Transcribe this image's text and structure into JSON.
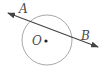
{
  "diagram": {
    "type": "circle-with-secant",
    "circle": {
      "center_label": "O",
      "cx": 47,
      "cy": 40,
      "r": 25,
      "stroke": "#a8a8a8"
    },
    "center_point": {
      "x": 46,
      "y": 41,
      "color": "#222222"
    },
    "line": {
      "x1": 8,
      "y1": 13,
      "x2": 98,
      "y2": 47,
      "stroke": "#444444",
      "arrows": "both"
    },
    "labels": {
      "A": "A",
      "B": "B",
      "O": "O"
    }
  }
}
